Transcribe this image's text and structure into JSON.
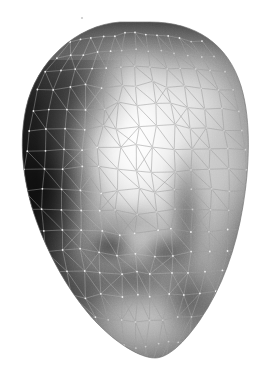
{
  "scene": {
    "title": "3D Triangulated Face Mesh Render",
    "subject": "human head surface",
    "render_style": "gouraud-shaded grayscale with wireframe overlay",
    "background_color": "#ffffff",
    "canvas_width": 274,
    "canvas_height": 377
  },
  "silhouette": {
    "name": "face-outline",
    "description": "egg shaped oval, wide rounded top, narrowing to chin at bottom",
    "path": "M 150 22 C 196 22 228 44 241 86 C 252 122 249 170 243 206 C 236 249 222 288 200 320 C 184 343 168 358 155 358 C 140 358 116 343 96 322 C 70 294 48 256 34 214 C 22 177 19 140 26 108 C 36 62 76 25 120 22 Z",
    "fill_color": "#8a8a8a",
    "outline_color": "#707070"
  },
  "shading": {
    "model": "diffuse lambert, single key light upper-center-right",
    "min_level": "#141414",
    "max_level": "#fcfcfc",
    "highlight_center": [
      139,
      128
    ],
    "highlight_label": "forehead-nose-bridge-specular",
    "lights": [
      {
        "name": "key-highlight",
        "cx": 139,
        "cy": 128,
        "rx": 62,
        "ry": 78,
        "color": "#ffffff",
        "opacity": 0.95
      },
      {
        "name": "secondary-cheek-highlight",
        "cx": 196,
        "cy": 96,
        "rx": 46,
        "ry": 56,
        "color": "#f0f0f0",
        "opacity": 0.5
      },
      {
        "name": "chin-lower-highlight",
        "cx": 150,
        "cy": 322,
        "rx": 62,
        "ry": 42,
        "color": "#e4e4e4",
        "opacity": 0.5
      },
      {
        "name": "right-rim-light",
        "cx": 228,
        "cy": 170,
        "rx": 32,
        "ry": 86,
        "color": "#cfcfcf",
        "opacity": 0.42
      }
    ],
    "shadows": [
      {
        "name": "left-side-terminator",
        "cx": 44,
        "cy": 186,
        "rx": 56,
        "ry": 120,
        "color": "#101010",
        "opacity": 0.92
      },
      {
        "name": "upper-left-falloff",
        "cx": 72,
        "cy": 86,
        "rx": 62,
        "ry": 66,
        "color": "#1c1c1c",
        "opacity": 0.72
      },
      {
        "name": "top-crown-shadow",
        "cx": 152,
        "cy": 36,
        "rx": 70,
        "ry": 26,
        "color": "#2a2a2a",
        "opacity": 0.68
      },
      {
        "name": "left-eye-socket",
        "cx": 110,
        "cy": 246,
        "rx": 26,
        "ry": 19,
        "color": "#0d0d0d",
        "opacity": 0.82
      },
      {
        "name": "right-eye-socket",
        "cx": 166,
        "cy": 252,
        "rx": 24,
        "ry": 21,
        "color": "#141414",
        "opacity": 0.7
      },
      {
        "name": "mouth-shadow-band",
        "cx": 136,
        "cy": 276,
        "rx": 58,
        "ry": 26,
        "color": "#262626",
        "opacity": 0.62
      },
      {
        "name": "nose-side-vertical-band",
        "cx": 186,
        "cy": 218,
        "rx": 20,
        "ry": 72,
        "color": "#303030",
        "opacity": 0.55
      },
      {
        "name": "lower-cheek-shadow",
        "cx": 186,
        "cy": 300,
        "rx": 30,
        "ry": 34,
        "color": "#343434",
        "opacity": 0.45
      },
      {
        "name": "left-jaw-shadow",
        "cx": 78,
        "cy": 292,
        "rx": 40,
        "ry": 44,
        "color": "#2e2e2e",
        "opacity": 0.5
      },
      {
        "name": "right-edge-falloff",
        "cx": 248,
        "cy": 250,
        "rx": 22,
        "ry": 78,
        "color": "#3a3a3a",
        "opacity": 0.45
      }
    ]
  },
  "wireframe": {
    "visible": true,
    "edge_color_light_regions": "#9a9a9a",
    "edge_color_dark_regions": "#b8b8b8",
    "edge_width": 0.7,
    "vertex_dot_color": "#f2f2f2",
    "vertex_dot_radius": 0.9,
    "topology": "irregular triangulated mesh, denser over central facial features, regular quad-diagonal grid on right cheek",
    "approx_vertex_count": 420,
    "approx_triangle_count": 780
  },
  "grid": {
    "vertical_lines_x": [
      48,
      70,
      92,
      114,
      136,
      158,
      180,
      202,
      224
    ],
    "horizontal_lines_y": [
      44,
      66,
      88,
      110,
      132,
      154,
      176,
      198,
      220,
      242,
      264,
      286,
      308,
      330,
      352
    ],
    "spacing": 22
  },
  "annotations": {
    "speck_marks": [
      {
        "name": "upper-speck",
        "x": 82,
        "y": 18,
        "size": 2
      }
    ]
  }
}
